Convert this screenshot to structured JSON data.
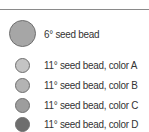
{
  "legend": {
    "items": [
      {
        "label": "6° seed bead",
        "color": "#a6a6a6",
        "size": 27,
        "center_y": 33
      },
      {
        "label": "11° seed bead, color A",
        "color": "#c4c4c4",
        "size": 15,
        "center_y": 65
      },
      {
        "label": "11° seed bead, color B",
        "color": "#b3b3b3",
        "size": 15,
        "center_y": 85
      },
      {
        "label": "11° seed bead, color C",
        "color": "#9d9d9d",
        "size": 15,
        "center_y": 105
      },
      {
        "label": "11° seed bead, color D",
        "color": "#6e6e6e",
        "size": 15,
        "center_y": 124
      }
    ]
  }
}
